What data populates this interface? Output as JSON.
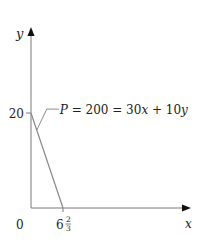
{
  "chart_data": {
    "type": "line",
    "title": "",
    "xlabel": "x",
    "ylabel": "y",
    "xlim": [
      0,
      22
    ],
    "ylim": [
      0,
      38
    ],
    "origin_label": "0",
    "x_ticks": [
      {
        "value": 6.6667,
        "label_whole": "6",
        "label_num": "2",
        "label_den": "3"
      }
    ],
    "y_ticks": [
      {
        "value": 20,
        "label": "20"
      }
    ],
    "series": [
      {
        "name": "P = 200 = 30x + 10y",
        "points": [
          [
            0,
            20
          ],
          [
            6.6667,
            0
          ]
        ],
        "color": "#888888"
      }
    ],
    "annotations": [
      {
        "text": "P = 200 = 30x + 10y",
        "target_series": 0,
        "anchor_point": [
          1.2,
          16.4
        ]
      }
    ],
    "grid": false,
    "legend": "none"
  },
  "colors": {
    "axis": "#7a7a7a",
    "line": "#8c8c8c",
    "text": "#222222"
  }
}
